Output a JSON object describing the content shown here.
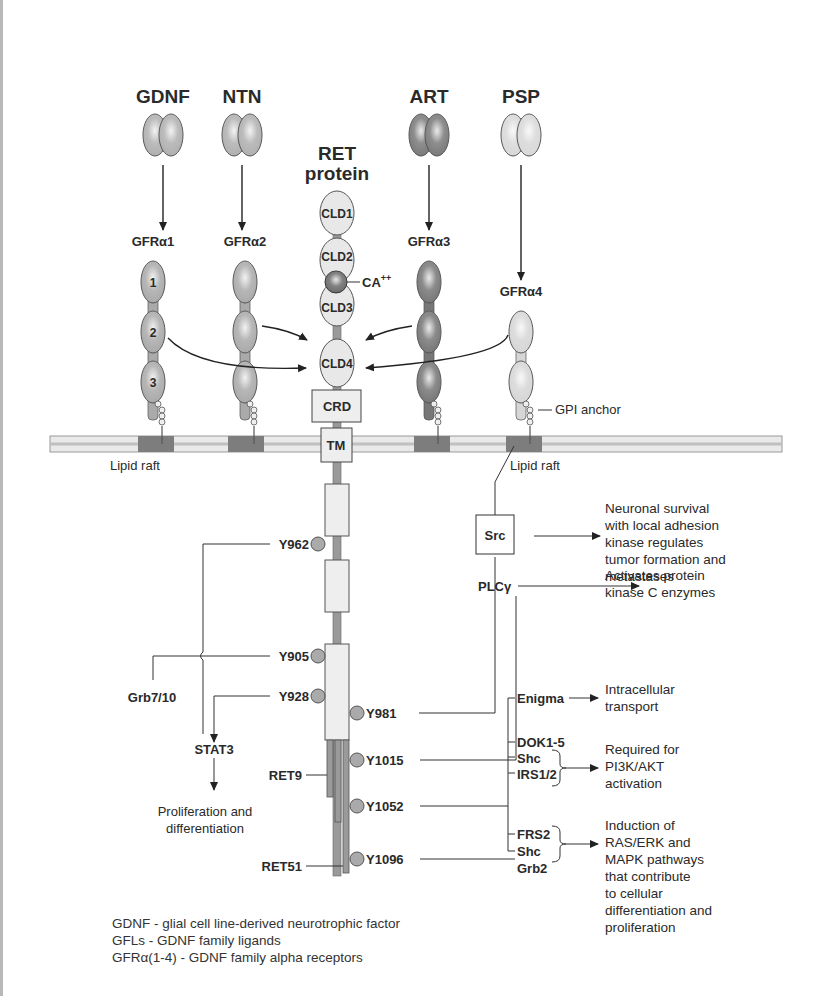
{
  "ligands": [
    {
      "id": "gdnf",
      "label": "GDNF",
      "x": 163,
      "fill": "#b0b0b0"
    },
    {
      "id": "ntn",
      "label": "NTN",
      "x": 242,
      "fill": "#b0b0b0"
    },
    {
      "id": "art",
      "label": "ART",
      "x": 429,
      "fill": "#7a7a7a"
    },
    {
      "id": "psp",
      "label": "PSP",
      "x": 521,
      "fill": "#d8d8d8"
    }
  ],
  "receptors": [
    {
      "id": "gfra1",
      "label": "GFRα1",
      "x": 153,
      "fill": "#aaaaaa",
      "domains": [
        "1",
        "2",
        "3"
      ],
      "top": 262
    },
    {
      "id": "gfra2",
      "label": "GFRα2",
      "x": 245,
      "fill": "#aaaaaa",
      "domains": [
        "",
        "",
        ""
      ],
      "top": 262
    },
    {
      "id": "gfra3",
      "label": "GFRα3",
      "x": 429,
      "fill": "#777777",
      "domains": [
        "",
        "",
        ""
      ],
      "top": 262
    },
    {
      "id": "gfra4",
      "label": "GFRα4",
      "x": 521,
      "fill": "#d6d6d6",
      "domains": [
        "",
        ""
      ],
      "top": 312
    }
  ],
  "ret": {
    "title_line1": "RET",
    "title_line2": "protein",
    "domains": [
      "CLD1",
      "CLD2",
      "CLD3",
      "CLD4"
    ],
    "calcium_label": "CA",
    "calcium_sup": "++",
    "crd_label": "CRD",
    "tm_label": "TM",
    "isoforms": {
      "ret9": "RET9",
      "ret51": "RET51"
    }
  },
  "membrane": {
    "lipid_raft_left": "Lipid raft",
    "lipid_raft_right": "Lipid raft",
    "gpi_anchor": "GPI anchor",
    "raft_color": "#7d7d7d",
    "band_color": "#cfcfcf"
  },
  "tyrosines_left": [
    {
      "label": "Y962",
      "y": 544
    },
    {
      "label": "Y905",
      "y": 656
    },
    {
      "label": "Y928",
      "y": 696
    }
  ],
  "tyrosines_right": [
    {
      "label": "Y981",
      "y": 713
    },
    {
      "label": "Y1015",
      "y": 760
    },
    {
      "label": "Y1052",
      "y": 806
    },
    {
      "label": "Y1096",
      "y": 859
    }
  ],
  "left_pathway": {
    "grb": "Grb7/10",
    "stat3": "STAT3",
    "outcome_line1": "Proliferation and",
    "outcome_line2": "differentiation"
  },
  "right_pathway": {
    "src": "Src",
    "plcg": "PLCγ",
    "adaptors": [
      "Enigma",
      "DOK1-5",
      "Shc",
      "IRS1/2",
      "FRS2",
      "Shc",
      "Grb2"
    ],
    "outcomes": {
      "src": [
        "Neuronal survival",
        "with local adhesion",
        "kinase regulates",
        "tumor formation and",
        "metastases"
      ],
      "plcg": [
        "Activates protein",
        "kinase C enzymes"
      ],
      "enigma": [
        "Intracellular",
        "transport"
      ],
      "pi3k": [
        "Required for",
        "PI3K/AKT",
        "activation"
      ],
      "ras": [
        "Induction of",
        "RAS/ERK and",
        "MAPK pathways",
        "that contribute",
        "to cellular",
        "differentiation and",
        "proliferation"
      ]
    }
  },
  "legend": [
    "GDNF - glial cell line-derived neurotrophic factor",
    "GFLs - GDNF family ligands",
    "GFRα(1-4) - GDNF family alpha receptors"
  ]
}
